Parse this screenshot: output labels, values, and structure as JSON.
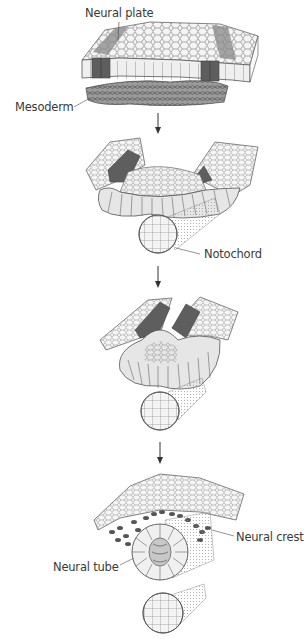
{
  "diagram": {
    "stages": [
      {
        "id": "neural-plate-stage",
        "order": 1
      },
      {
        "id": "neural-folds-stage",
        "order": 2
      },
      {
        "id": "neural-folds-closing-stage",
        "order": 3
      },
      {
        "id": "neural-tube-stage",
        "order": 4
      }
    ],
    "labels": {
      "neural_plate": "Neural plate",
      "mesoderm": "Mesoderm",
      "notochord": "Notochord",
      "neural_crest": "Neural crest",
      "neural_tube": "Neural tube"
    },
    "colors": {
      "outline": "#555555",
      "dark_cells": "#6a6a6a",
      "light_cells": "#e8e8e8",
      "mesoderm": "#8a8a8a",
      "crest_cells": "#5a5a5a"
    }
  }
}
